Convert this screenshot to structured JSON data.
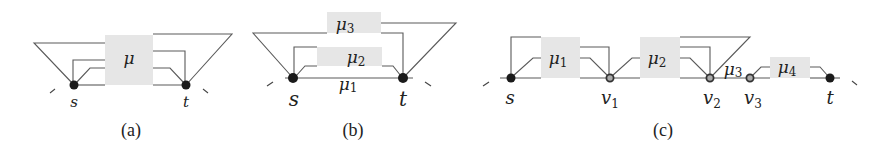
{
  "figure": {
    "panels": [
      {
        "caption": "(a)",
        "vertices": [
          {
            "id": "s",
            "label": "s",
            "style": "filled"
          },
          {
            "id": "t",
            "label": "t",
            "style": "filled"
          }
        ],
        "components": [
          {
            "symbol": "μ",
            "subscript": ""
          }
        ]
      },
      {
        "caption": "(b)",
        "vertices": [
          {
            "id": "s",
            "label": "s",
            "style": "filled"
          },
          {
            "id": "t",
            "label": "t",
            "style": "filled"
          }
        ],
        "components": [
          {
            "symbol": "μ",
            "subscript": "3"
          },
          {
            "symbol": "μ",
            "subscript": "2"
          },
          {
            "symbol": "μ",
            "subscript": "1",
            "kind": "edge"
          }
        ]
      },
      {
        "caption": "(c)",
        "vertices": [
          {
            "id": "s",
            "label": "s",
            "subscript": "",
            "style": "filled"
          },
          {
            "id": "v1",
            "label": "v",
            "subscript": "1",
            "style": "open"
          },
          {
            "id": "v2",
            "label": "v",
            "subscript": "2",
            "style": "open"
          },
          {
            "id": "v3",
            "label": "v",
            "subscript": "3",
            "style": "open"
          },
          {
            "id": "t",
            "label": "t",
            "subscript": "",
            "style": "filled"
          }
        ],
        "components": [
          {
            "symbol": "μ",
            "subscript": "1"
          },
          {
            "symbol": "μ",
            "subscript": "2"
          },
          {
            "symbol": "μ",
            "subscript": "3",
            "kind": "edge"
          },
          {
            "symbol": "μ",
            "subscript": "4"
          }
        ]
      }
    ]
  }
}
